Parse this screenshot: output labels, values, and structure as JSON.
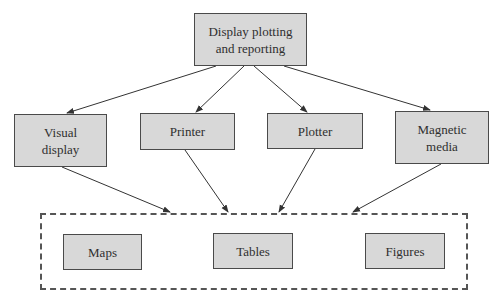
{
  "diagram": {
    "root": {
      "label": "Display plotting\nand reporting"
    },
    "outputs": [
      {
        "label": "Visual\ndisplay"
      },
      {
        "label": "Printer"
      },
      {
        "label": "Plotter"
      },
      {
        "label": "Magnetic\nmedia"
      }
    ],
    "products": [
      {
        "label": "Maps"
      },
      {
        "label": "Tables"
      },
      {
        "label": "Figures"
      }
    ],
    "edges": [
      {
        "from": "Display plotting and reporting",
        "to": "Visual display"
      },
      {
        "from": "Display plotting and reporting",
        "to": "Printer"
      },
      {
        "from": "Display plotting and reporting",
        "to": "Plotter"
      },
      {
        "from": "Display plotting and reporting",
        "to": "Magnetic media"
      },
      {
        "from": "Visual display",
        "to": "products-group"
      },
      {
        "from": "Printer",
        "to": "products-group"
      },
      {
        "from": "Plotter",
        "to": "products-group"
      },
      {
        "from": "Magnetic media",
        "to": "products-group"
      }
    ],
    "colors": {
      "box_fill": "#d8d8d8",
      "box_border": "#4a4a4a",
      "line": "#333333"
    }
  }
}
